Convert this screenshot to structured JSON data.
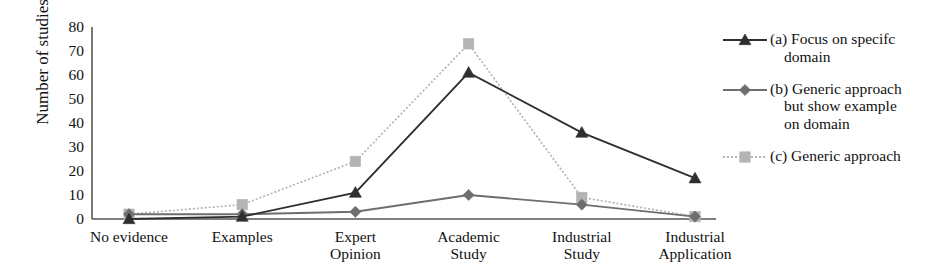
{
  "chart_data": {
    "type": "line",
    "title": "",
    "xlabel": "",
    "ylabel": "Number of studies",
    "categories": [
      "No evidence",
      "Examples",
      "Expert Opinion",
      "Academic Study",
      "Industrial Study",
      "Industrial Application"
    ],
    "category_lines": [
      [
        "No evidence"
      ],
      [
        "Examples"
      ],
      [
        "Expert",
        "Opinion"
      ],
      [
        "Academic",
        "Study"
      ],
      [
        "Industrial",
        "Study"
      ],
      [
        "Industrial",
        "Application"
      ]
    ],
    "ylim": [
      0,
      80
    ],
    "yticks": [
      80,
      70,
      60,
      50,
      40,
      30,
      20,
      10,
      0
    ],
    "grid": false,
    "legend_position": "right",
    "series": [
      {
        "name": "(a) Focus on specifc domain",
        "label_lines": [
          "(a) Focus on specifc",
          "domain"
        ],
        "values": [
          0,
          1,
          11,
          61,
          36,
          17
        ],
        "color": "#2f2f2f",
        "marker": "triangle",
        "linestyle": "solid"
      },
      {
        "name": "(b) Generic approach but show example on domain",
        "label_lines": [
          "(b) Generic approach",
          "but show example",
          "on domain"
        ],
        "values": [
          2,
          2,
          3,
          10,
          6,
          1
        ],
        "color": "#6e6e6e",
        "marker": "diamond",
        "linestyle": "solid"
      },
      {
        "name": "(c) Generic approach",
        "label_lines": [
          "(c) Generic approach"
        ],
        "values": [
          2,
          6,
          24,
          73,
          9,
          1
        ],
        "color": "#b4b4b4",
        "marker": "square",
        "linestyle": "dotted"
      }
    ]
  },
  "axis": {
    "ylabel": "Number of studies",
    "ytick_labels": [
      "80",
      "70",
      "60",
      "50",
      "40",
      "30",
      "20",
      "10",
      "0"
    ]
  }
}
